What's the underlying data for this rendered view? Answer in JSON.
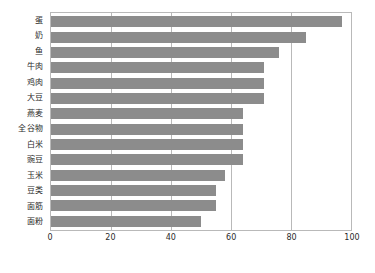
{
  "chart_data": {
    "type": "bar",
    "orientation": "horizontal",
    "title": "",
    "subtitle": "",
    "xlabel": "",
    "ylabel": "",
    "xlim": [
      0,
      100
    ],
    "xticks": [
      0,
      20,
      40,
      60,
      80,
      100
    ],
    "xtick_labels": [
      "0",
      "20",
      "40",
      "60",
      "80",
      "100"
    ],
    "grid": "vertical",
    "legend": "none",
    "categories": [
      "蛋",
      "奶",
      "鱼",
      "牛肉",
      "鸡肉",
      "大豆",
      "燕麦",
      "全谷物",
      "白米",
      "豌豆",
      "玉米",
      "豆类",
      "面筋",
      "面粉"
    ],
    "values": [
      97,
      85,
      76,
      71,
      71,
      71,
      64,
      64,
      64,
      64,
      58,
      55,
      55,
      50
    ],
    "series": [
      {
        "name": "",
        "values": [
          97,
          85,
          76,
          71,
          71,
          71,
          64,
          64,
          64,
          64,
          58,
          55,
          55,
          50
        ]
      }
    ],
    "bars": [
      {
        "label": "蛋",
        "value": 97
      },
      {
        "label": "奶",
        "value": 85
      },
      {
        "label": "鱼",
        "value": 76
      },
      {
        "label": "牛肉",
        "value": 71
      },
      {
        "label": "鸡肉",
        "value": 71
      },
      {
        "label": "大豆",
        "value": 71
      },
      {
        "label": "燕麦",
        "value": 64
      },
      {
        "label": "全谷物",
        "value": 64
      },
      {
        "label": "白米",
        "value": 64
      },
      {
        "label": "豌豆",
        "value": 64
      },
      {
        "label": "玉米",
        "value": 58
      },
      {
        "label": "豆类",
        "value": 55
      },
      {
        "label": "面筋",
        "value": 55
      },
      {
        "label": "面粉",
        "value": 50
      }
    ]
  },
  "colors": {
    "bar": "#8c8c8c",
    "grid": "#b9b9b9",
    "frame": "#b9b9b9",
    "text": "#2b2b2b",
    "background": "#ffffff"
  }
}
